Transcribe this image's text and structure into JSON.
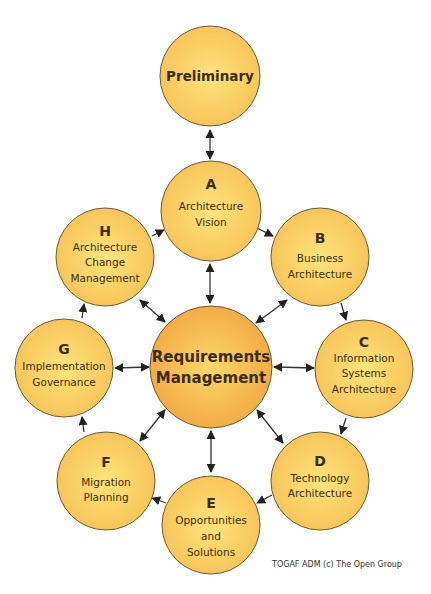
{
  "diagram": {
    "type": "cycle-diagram",
    "colors": {
      "phase_fill_center": "#fde47a",
      "phase_fill_edge": "#f7c257",
      "center_fill_center": "#fbd86a",
      "center_fill_edge": "#f2a742",
      "stroke": "#6b5a3a",
      "arrow": "#222222"
    },
    "preliminary": {
      "label": "Preliminary"
    },
    "center": {
      "line1": "Requirements",
      "line2": "Management"
    },
    "phases": [
      {
        "letter": "A",
        "lines": [
          "Architecture",
          "Vision"
        ]
      },
      {
        "letter": "B",
        "lines": [
          "Business",
          "Architecture"
        ]
      },
      {
        "letter": "C",
        "lines": [
          "Information",
          "Systems",
          "Architecture"
        ]
      },
      {
        "letter": "D",
        "lines": [
          "Technology",
          "Architecture"
        ]
      },
      {
        "letter": "E",
        "lines": [
          "Opportunities",
          "and",
          "Solutions"
        ]
      },
      {
        "letter": "F",
        "lines": [
          "Migration",
          "Planning"
        ]
      },
      {
        "letter": "G",
        "lines": [
          "Implementation",
          "Governance"
        ]
      },
      {
        "letter": "H",
        "lines": [
          "Architecture",
          "Change",
          "Management"
        ]
      }
    ]
  },
  "footer": {
    "credit": "TOGAF ADM (c) The Open Group"
  }
}
